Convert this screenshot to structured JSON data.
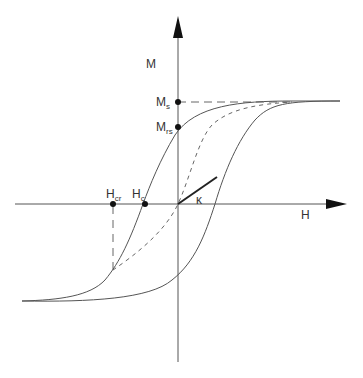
{
  "diagram": {
    "axes": {
      "x_label": "H",
      "y_label": "M"
    },
    "labels": {
      "Ms": {
        "main": "M",
        "sub": "s"
      },
      "Mrs": {
        "main": "M",
        "sub": "rs"
      },
      "Hc": {
        "main": "H",
        "sub": "c"
      },
      "Hcr": {
        "main": "H",
        "sub": "cr"
      },
      "kappa": "κ"
    },
    "colors": {
      "axis": "#555555",
      "curve": "#555555",
      "dashed": "#666666",
      "tangent": "#222222",
      "point": "#111111"
    },
    "elements": [
      "ascending branch (solid)",
      "descending branch (solid)",
      "initial magnetization curve (dashed)",
      "saturation reference line (dashed)",
      "H_cr projection line (dashed)",
      "initial susceptibility tangent kappa"
    ]
  }
}
